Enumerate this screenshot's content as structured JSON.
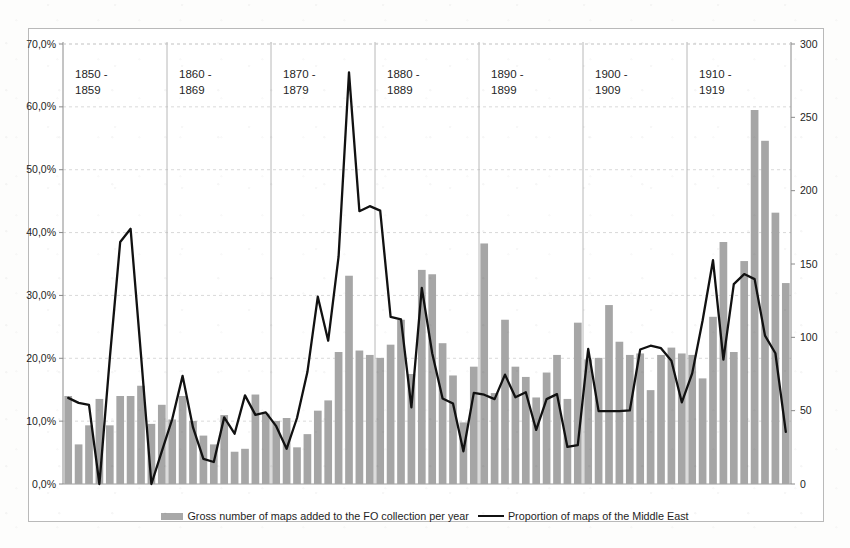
{
  "chart_data": {
    "type": "bar",
    "title": "",
    "subtitle": "",
    "xlabel": "",
    "ylabel": "",
    "y_left": {
      "label": "Proportion of maps of the Middle East",
      "ticks": [
        "0,0%",
        "10,0%",
        "20,0%",
        "30,0%",
        "40,0%",
        "50,0%",
        "60,0%",
        "70,0%"
      ],
      "min": 0,
      "max": 70,
      "step": 10,
      "unit": "%"
    },
    "y_right": {
      "label": "Gross number of maps added to the FO collection per year",
      "ticks": [
        "0",
        "50",
        "100",
        "150",
        "200",
        "250",
        "300"
      ],
      "min": 0,
      "max": 300,
      "step": 50
    },
    "grid": true,
    "legend_position": "bottom",
    "decades": [
      {
        "label_line1": "1850 -",
        "label_line2": "1859"
      },
      {
        "label_line1": "1860 -",
        "label_line2": "1869"
      },
      {
        "label_line1": "1870 -",
        "label_line2": "1879"
      },
      {
        "label_line1": "1880 -",
        "label_line2": "1889"
      },
      {
        "label_line1": "1890 -",
        "label_line2": "1899"
      },
      {
        "label_line1": "1900 -",
        "label_line2": "1909"
      },
      {
        "label_line1": "1910 -",
        "label_line2": "1919"
      }
    ],
    "x": [
      1850,
      1851,
      1852,
      1853,
      1854,
      1855,
      1856,
      1857,
      1858,
      1859,
      1860,
      1861,
      1862,
      1863,
      1864,
      1865,
      1866,
      1867,
      1868,
      1869,
      1870,
      1871,
      1872,
      1873,
      1874,
      1875,
      1876,
      1877,
      1878,
      1879,
      1880,
      1881,
      1882,
      1883,
      1884,
      1885,
      1886,
      1887,
      1888,
      1889,
      1890,
      1891,
      1892,
      1893,
      1894,
      1895,
      1896,
      1897,
      1898,
      1899,
      1900,
      1901,
      1902,
      1903,
      1904,
      1905,
      1906,
      1907,
      1908,
      1909,
      1910,
      1911,
      1912,
      1913,
      1914,
      1915,
      1916,
      1917,
      1918,
      1919
    ],
    "series": [
      {
        "name": "Gross number of maps added to the FO collection per year",
        "type": "bar",
        "axis": "right",
        "color": "#a6a6a6",
        "values": [
          60,
          27,
          40,
          58,
          40,
          60,
          60,
          67,
          41,
          54,
          44,
          60,
          43,
          33,
          27,
          47,
          22,
          24,
          61,
          48,
          43,
          45,
          25,
          34,
          50,
          57,
          90,
          142,
          91,
          88,
          86,
          95,
          112,
          75,
          146,
          143,
          96,
          74,
          42,
          80,
          164,
          62,
          112,
          80,
          73,
          59,
          76,
          88,
          58,
          110,
          85,
          86,
          122,
          97,
          88,
          89,
          64,
          88,
          93,
          89,
          88,
          72,
          114,
          165,
          90,
          152,
          255,
          234,
          185,
          137
        ]
      },
      {
        "name": "Proportion of maps of the Middle East",
        "type": "line",
        "axis": "left",
        "color": "#111111",
        "values": [
          13.7,
          12.9,
          12.6,
          0.0,
          20.0,
          38.5,
          40.6,
          20.5,
          0.0,
          5.2,
          10.3,
          17.2,
          9.0,
          4.0,
          3.5,
          10.6,
          8.0,
          14.1,
          11.0,
          11.4,
          9.2,
          5.6,
          10.5,
          17.8,
          29.8,
          22.8,
          36.2,
          65.5,
          43.4,
          44.2,
          43.5,
          26.6,
          26.2,
          12.2,
          31.2,
          20.8,
          13.6,
          12.8,
          5.2,
          14.5,
          14.2,
          13.5,
          17.4,
          13.8,
          14.6,
          8.6,
          13.5,
          14.3,
          5.9,
          6.2,
          21.5,
          11.6,
          11.6,
          11.6,
          11.7,
          21.4,
          22.0,
          21.6,
          19.6,
          13.0,
          17.6,
          26.0,
          35.6,
          19.8,
          31.8,
          33.4,
          32.6,
          23.6,
          20.8,
          8.3
        ]
      }
    ]
  },
  "legend": {
    "bar_label": "Gross number of maps added to the FO collection per year",
    "line_label": "Proportion of maps of the Middle East"
  }
}
